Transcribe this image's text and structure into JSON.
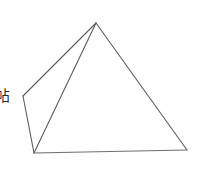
{
  "canvas": {
    "width": 199,
    "height": 176,
    "background_color": "#fefefe"
  },
  "figure": {
    "name": "square-pyramid-wireframe",
    "stroke_color": "#5c5c5c",
    "stroke_width": 1.1,
    "fill": "none",
    "vertices": {
      "apex": {
        "x": 96,
        "y": 23
      },
      "base_left": {
        "x": 23,
        "y": 96
      },
      "base_front": {
        "x": 34,
        "y": 153
      },
      "base_right": {
        "x": 187,
        "y": 150
      }
    },
    "edges": [
      {
        "name": "apex-to-base-left",
        "from": "apex",
        "to": "base_left"
      },
      {
        "name": "apex-to-base-front",
        "from": "apex",
        "to": "base_front"
      },
      {
        "name": "apex-to-base-right",
        "from": "apex",
        "to": "base_right"
      },
      {
        "name": "base-left-to-base-front",
        "from": "base_left",
        "to": "base_front"
      },
      {
        "name": "base-front-to-base-right",
        "from": "base_front",
        "to": "base_right"
      }
    ]
  },
  "labels": {
    "side_text": "帖"
  }
}
